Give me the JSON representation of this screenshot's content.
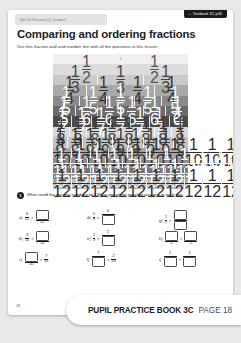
{
  "header": {
    "unit_tab": "Unit 10: Fractions (2), Lesson 5",
    "textbook_tab": "Textbook 3C p34",
    "textbook_tab_arrow": "→",
    "title": "Comparing and ordering fractions",
    "subtitle": "Use this fraction wall and number line with all the questions in this lesson."
  },
  "fraction_wall": {
    "rows": [
      {
        "denominator": 1,
        "color": "#f0f0f0",
        "text": "#555555",
        "labels": [
          "1"
        ]
      },
      {
        "denominator": 2,
        "color": "#dcdcdc",
        "text": "#555555",
        "labels": [
          "1/2",
          "1/2"
        ]
      },
      {
        "denominator": 3,
        "color": "#c9c9c9",
        "text": "#444444",
        "labels": [
          "1/3",
          "1/3",
          "1/3"
        ]
      },
      {
        "denominator": 4,
        "color": "#a9a9a9",
        "text": "#333333",
        "labels": [
          "1/4",
          "1/4",
          "1/4",
          "1/4"
        ]
      },
      {
        "denominator": 5,
        "color": "#8a8a8a",
        "text": "#ffffff",
        "labels": [
          "1/5",
          "1/5",
          "1/5",
          "1/5",
          "1/5"
        ]
      },
      {
        "denominator": 6,
        "color": "#6b6b6b",
        "text": "#ffffff",
        "labels": [
          "1/6",
          "1/6",
          "1/6",
          "1/6",
          "1/6",
          "1/6"
        ]
      },
      {
        "denominator": 7,
        "color": "#4a4a4a",
        "text": "#ffffff",
        "labels": [
          "1/7",
          "1/7",
          "1/7",
          "1/7",
          "1/7",
          "1/7",
          "1/7"
        ]
      },
      {
        "denominator": 8,
        "color": "#d8d8d8",
        "text": "#3a3a3a",
        "labels": [
          "1/8",
          "1/8",
          "1/8",
          "1/8",
          "1/8",
          "1/8",
          "1/8",
          "1/8"
        ]
      },
      {
        "denominator": 9,
        "color": "#c2c2c2",
        "text": "#3a3a3a",
        "labels": [
          "1/9",
          "1/9",
          "1/9",
          "1/9",
          "1/9",
          "1/9",
          "1/9",
          "1/9",
          "1/9"
        ]
      },
      {
        "denominator": 10,
        "color": "#a6a6a6",
        "text": "#2e2e2e",
        "labels": [
          "1/10",
          "1/10",
          "1/10",
          "1/10",
          "1/10",
          "1/10",
          "1/10",
          "1/10",
          "1/10",
          "1/10"
        ]
      },
      {
        "denominator": 11,
        "color": "#8f8f8f",
        "text": "#ffffff",
        "labels": [
          "1/11",
          "1/11",
          "1/11",
          "1/11",
          "1/11",
          "1/11",
          "1/11",
          "1/11",
          "1/11",
          "1/11",
          "1/11"
        ]
      },
      {
        "denominator": 12,
        "color": "#747474",
        "text": "#ffffff",
        "labels": [
          "1/12",
          "1/12",
          "1/12",
          "1/12",
          "1/12",
          "1/12",
          "1/12",
          "1/12",
          "1/12",
          "1/12",
          "1/12",
          "1/12"
        ]
      },
      {
        "denominator": 12,
        "color": "#bdbdbd",
        "text": "#2e2e2e",
        "labels": [
          "1/12",
          "1/12",
          "1/12",
          "1/12",
          "1/12",
          "1/12",
          "1/12",
          "1/12",
          "1/12",
          "1/12",
          "1/12",
          "1/12"
        ]
      }
    ]
  },
  "number_line": {
    "start_label": "0",
    "end_label": "1",
    "divisions": 12
  },
  "question": {
    "number": "1",
    "text": "What could the missing numbers be? Write one of the possible answers in each box.",
    "items": [
      {
        "label": "a)",
        "left_num": "6",
        "left_den": "12",
        "op": "<",
        "right_num": "BOX",
        "right_den": "12"
      },
      {
        "label": "b)",
        "left_num": "3",
        "left_den": "10",
        "op": ">",
        "right_num": "BOX",
        "right_den": "10"
      },
      {
        "label": "c)",
        "left_num": "BOX",
        "left_den": "10",
        "op": "<",
        "right_num": "7",
        "right_den": "10"
      },
      {
        "label": "d)",
        "left_num": "5",
        "left_den": "8",
        "op": "<",
        "right_num": "6",
        "right_den": "BOX"
      },
      {
        "label": "e)",
        "left_num": "2",
        "left_den": "3",
        "op": ">",
        "right_num": "2",
        "right_den": "BOX"
      },
      {
        "label": "f)",
        "left_num": "7",
        "left_den": "BOX",
        "op": ">",
        "right_num": "2",
        "right_den": "10"
      },
      {
        "label": "g)",
        "left_num": "1",
        "left_den": "2",
        "op": "<",
        "right_num": "BOX",
        "right_den": "BOX"
      },
      {
        "label": "h)",
        "left_num": "BOX",
        "left_den": "2",
        "op": ">",
        "right_num": "BOX",
        "right_den": "2"
      },
      {
        "label": "i)",
        "left_num": "2",
        "left_den": "BOX",
        "op": "<",
        "right_num": "2",
        "right_den": "BOX"
      }
    ]
  },
  "footer": {
    "page_number": "18",
    "book_title": "PUPIL PRACTICE BOOK 3C",
    "page_label": "PAGE 18"
  }
}
